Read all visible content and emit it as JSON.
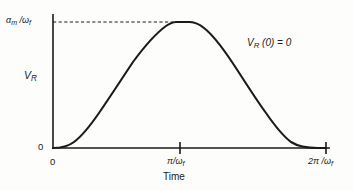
{
  "figure": {
    "background_color": "#fdfdfc",
    "ink_color": "#1a1a1a"
  },
  "axes": {
    "y_axis_title": "V_R",
    "y_tick_max_label": "α_m /ω_f",
    "y_tick_zero_label": "0",
    "x_axis_title": "Time",
    "x_tick_labels": [
      "0",
      "π/ω_f",
      "2π /ω_f"
    ]
  },
  "annotation": {
    "text": "V_R (0) = 0"
  },
  "chart_data": {
    "type": "line",
    "title": "",
    "xlabel": "Time",
    "ylabel": "V_R",
    "grid": false,
    "legend": "none",
    "xlim": [
      0,
      6.2832
    ],
    "ylim": [
      0,
      1
    ],
    "x_tick_values": [
      0,
      3.1416,
      6.2832
    ],
    "x_tick_labels": [
      "0",
      "π/ω_f",
      "2π /ω_f"
    ],
    "y_tick_values": [
      0,
      1
    ],
    "y_tick_labels": [
      "0",
      "α_m /ω_f"
    ],
    "annotations": [
      {
        "text": "V_R (0) = 0",
        "x": 4.7,
        "y": 0.88
      }
    ],
    "reference_lines": [
      {
        "orientation": "horizontal",
        "y": 1,
        "style": "dashed",
        "label": "α_m /ω_f",
        "x_from": 0,
        "x_to": 3.1416
      }
    ],
    "series": [
      {
        "name": "V_R(t)",
        "style": "solid",
        "color": "#1a1a1a",
        "description": "Raised-cosine pulse rising from 0, flat plateau at peak value α_m/ω_f, returning to 0",
        "x": [
          0.0,
          0.25,
          0.5,
          0.75,
          1.0,
          1.26,
          1.51,
          1.76,
          2.01,
          2.26,
          2.51,
          2.76,
          2.9,
          3.02,
          3.14,
          3.26,
          3.39,
          3.52,
          3.77,
          4.02,
          4.27,
          4.52,
          4.78,
          5.03,
          5.28,
          5.53,
          5.78,
          6.03,
          6.28
        ],
        "y": [
          0.0,
          0.01,
          0.039,
          0.087,
          0.146,
          0.222,
          0.309,
          0.404,
          0.5,
          0.596,
          0.691,
          0.778,
          0.845,
          0.96,
          1.0,
          1.0,
          0.96,
          0.9,
          0.778,
          0.691,
          0.596,
          0.5,
          0.404,
          0.309,
          0.222,
          0.146,
          0.087,
          0.025,
          0.0
        ]
      }
    ]
  }
}
